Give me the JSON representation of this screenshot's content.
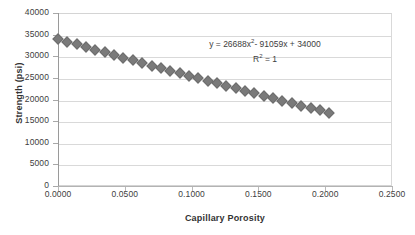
{
  "chart_data": {
    "type": "scatter",
    "title": "",
    "xlabel": "Capillary Porosity",
    "ylabel": "Strength (psi)",
    "xlim": [
      0.0,
      0.25
    ],
    "ylim": [
      0,
      40000
    ],
    "grid": true,
    "legend": "none",
    "x_ticks": [
      "0.0000",
      "0.0500",
      "0.1000",
      "0.1500",
      "0.2000",
      "0.2500"
    ],
    "x_tick_values": [
      0.0,
      0.05,
      0.1,
      0.15,
      0.2,
      0.25
    ],
    "y_ticks": [
      "0",
      "5000",
      "10000",
      "15000",
      "20000",
      "25000",
      "30000",
      "35000",
      "40000"
    ],
    "y_tick_values": [
      0,
      5000,
      10000,
      15000,
      20000,
      25000,
      30000,
      35000,
      40000
    ],
    "annotations": {
      "equation_prefix": "y =  26688x",
      "equation_exponent": "2",
      "equation_suffix": "- 91059x + 34000",
      "r_squared_prefix": "R",
      "r_squared_exponent": "2",
      "r_squared_suffix": " = 1"
    },
    "marker_style": "diamond",
    "marker_color": "#7a7a7a",
    "gridline_color": "#d9d9d9",
    "background_color": "#ffffff",
    "series": [
      {
        "name": "Strength vs Capillary Porosity",
        "x": [
          0.0,
          0.007,
          0.014,
          0.021,
          0.028,
          0.035,
          0.042,
          0.049,
          0.056,
          0.063,
          0.07,
          0.077,
          0.084,
          0.091,
          0.098,
          0.105,
          0.112,
          0.119,
          0.126,
          0.133,
          0.14,
          0.147,
          0.154,
          0.161,
          0.168,
          0.175,
          0.182,
          0.189,
          0.196,
          0.203
        ],
        "y": [
          34000,
          33374,
          32750,
          32129,
          31511,
          30896,
          30283,
          29673,
          29066,
          28462,
          27860,
          27261,
          26665,
          26072,
          25481,
          24893,
          24308,
          23726,
          23146,
          22569,
          21995,
          21424,
          20855,
          20289,
          19726,
          19166,
          18608,
          18053,
          17501,
          16952
        ]
      }
    ]
  }
}
